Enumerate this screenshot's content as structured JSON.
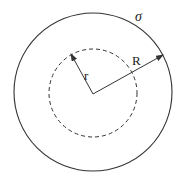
{
  "diagram": {
    "title": "",
    "colors": {
      "stroke": "#333333",
      "background": "#ffffff",
      "text": "#222222"
    },
    "center": {
      "x": 93,
      "y": 93
    },
    "outer_circle": {
      "radius": 79,
      "style": "solid",
      "label": "σ"
    },
    "inner_circle": {
      "radius": 43,
      "style": "dashed"
    },
    "radii": [
      {
        "label": "r",
        "to": {
          "x": 71,
          "y": 54
        },
        "target": "inner_circle"
      },
      {
        "label": "R",
        "to": {
          "x": 163,
          "y": 54
        },
        "target": "outer_circle"
      }
    ],
    "labels": {
      "sigma": "σ",
      "small_r": "r",
      "big_r": "R"
    }
  }
}
